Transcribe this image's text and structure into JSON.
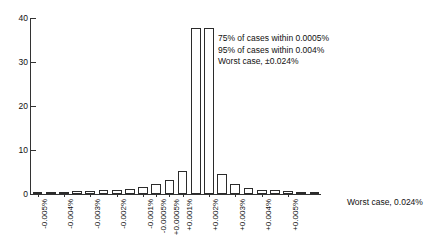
{
  "chart_data": {
    "type": "bar",
    "title": "",
    "subtitle": "",
    "xlabel": "",
    "ylabel": "",
    "ylim": [
      0,
      40
    ],
    "yticks": [
      0,
      10,
      20,
      30,
      40
    ],
    "grid": false,
    "legend": null,
    "categories": [
      "-0.005%",
      "",
      "-0.004%",
      "",
      "-0.003%",
      "",
      "-0.002%",
      "",
      "-0.001%",
      "-0.0005%",
      "+0.0005%",
      "+0.001%",
      "",
      "+0.002%",
      "",
      "+0.003%",
      "",
      "+0.004%",
      "",
      "+0.005%",
      "",
      ""
    ],
    "tick_labels": [
      "-0.005%",
      "-0.004%",
      "-0.003%",
      "-0.002%",
      "-0.001%",
      "-0.0005%",
      "+0.0005%",
      "+0.001%",
      "+0.002%",
      "+0.003%",
      "+0.004%",
      "+0.005%"
    ],
    "values": [
      0.4,
      0.4,
      0.5,
      0.6,
      0.7,
      0.8,
      1.0,
      1.2,
      1.6,
      2.2,
      3.1,
      5.2,
      37.8,
      37.8,
      4.6,
      2.2,
      1.4,
      1.0,
      0.8,
      0.6,
      0.5,
      0.4
    ],
    "annotations": [
      "75% of cases within 0.0005%",
      "95% of cases within 0.004%",
      "Worst case, ±0.024%"
    ],
    "axis_caption": "Worst case, 0.024%"
  },
  "style": {
    "bar_fill": "#ffffff",
    "bar_stroke": "#2b2b2b",
    "axis_color": "#333333",
    "text_color": "#111111"
  }
}
